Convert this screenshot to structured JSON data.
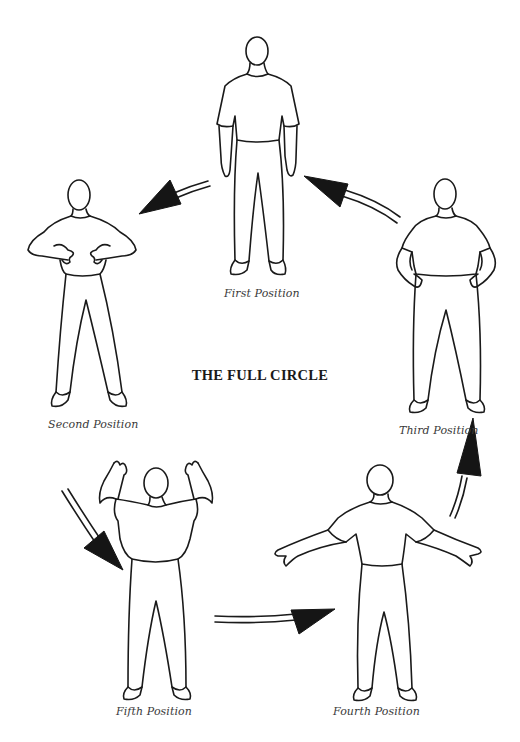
{
  "diagram": {
    "title": "THE FULL CIRCLE",
    "positions": [
      {
        "id": "first",
        "label": "First Position",
        "pose": "arms relaxed at sides"
      },
      {
        "id": "second",
        "label": "Second Position",
        "pose": "hands in front of chest"
      },
      {
        "id": "third",
        "label": "Third Position",
        "pose": "hands on hips"
      },
      {
        "id": "fourth",
        "label": "Fourth Position",
        "pose": "arms extended outward"
      },
      {
        "id": "fifth",
        "label": "Fifth Position",
        "pose": "arms raised above shoulders"
      }
    ],
    "flow": [
      {
        "from": "first",
        "to": "second"
      },
      {
        "from": "second",
        "to": "fifth"
      },
      {
        "from": "fifth",
        "to": "fourth"
      },
      {
        "from": "fourth",
        "to": "third"
      },
      {
        "from": "third",
        "to": "first"
      }
    ],
    "colors": {
      "ink": "#1a1a1a",
      "background": "#ffffff",
      "caption": "#3a3a3a"
    }
  }
}
